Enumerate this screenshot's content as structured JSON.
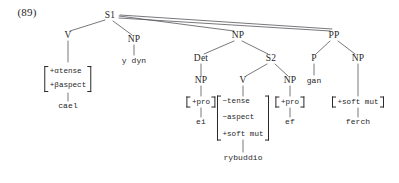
{
  "figure": {
    "example_number": "(89)",
    "language": "Welsh",
    "type": "syntax-tree"
  },
  "tree": {
    "root": {
      "label": "S1",
      "x": 110,
      "y": 16
    },
    "nodes": [
      {
        "id": "v1",
        "label": "V",
        "x": 68,
        "y": 36
      },
      {
        "id": "np_ydyn",
        "label": "NP",
        "x": 134,
        "y": 40
      },
      {
        "id": "np_obj",
        "label": "NP",
        "x": 238,
        "y": 36
      },
      {
        "id": "pp",
        "label": "PP",
        "x": 334,
        "y": 36
      },
      {
        "id": "det",
        "label": "Det",
        "x": 201,
        "y": 59
      },
      {
        "id": "s2",
        "label": "S2",
        "x": 271,
        "y": 59
      },
      {
        "id": "det_np",
        "label": "NP",
        "x": 201,
        "y": 81
      },
      {
        "id": "v2",
        "label": "V",
        "x": 243,
        "y": 81
      },
      {
        "id": "np_ef",
        "label": "NP",
        "x": 290,
        "y": 81
      },
      {
        "id": "p",
        "label": "P",
        "x": 314,
        "y": 59
      },
      {
        "id": "np_ferch",
        "label": "NP",
        "x": 358,
        "y": 59
      }
    ],
    "matrices": [
      {
        "id": "m_cael",
        "x": 68,
        "y": 79,
        "size": "mid",
        "rows": [
          "+αtense",
          "+βaspect"
        ]
      },
      {
        "id": "m_ei",
        "x": 201,
        "y": 102,
        "size": "single",
        "rows": [
          "+pro"
        ]
      },
      {
        "id": "m_rybuddio",
        "x": 243,
        "y": 118,
        "size": "tall",
        "rows": [
          "−tense",
          "−aspect",
          "+soft mut"
        ]
      },
      {
        "id": "m_ef",
        "x": 290,
        "y": 102,
        "size": "single",
        "rows": [
          "+pro"
        ]
      },
      {
        "id": "m_ferch",
        "x": 358,
        "y": 102,
        "size": "single",
        "rows": [
          "+soft mut"
        ]
      }
    ],
    "terminals": [
      {
        "id": "t_cael",
        "label": "cael",
        "x": 68,
        "y": 106
      },
      {
        "id": "t_ydyn",
        "label": "y dyn",
        "x": 134,
        "y": 61
      },
      {
        "id": "t_ei",
        "label": "ei",
        "x": 201,
        "y": 122
      },
      {
        "id": "t_rybuddio",
        "label": "rybuddio",
        "x": 243,
        "y": 158
      },
      {
        "id": "t_ef",
        "label": "ef",
        "x": 290,
        "y": 122
      },
      {
        "id": "t_gan",
        "label": "gan",
        "x": 314,
        "y": 81
      },
      {
        "id": "t_ferch",
        "label": "ferch",
        "x": 358,
        "y": 122
      }
    ]
  },
  "style": {
    "line_color": "#55555a",
    "text_color": "#1f1f1f",
    "background": "#ffffff"
  }
}
